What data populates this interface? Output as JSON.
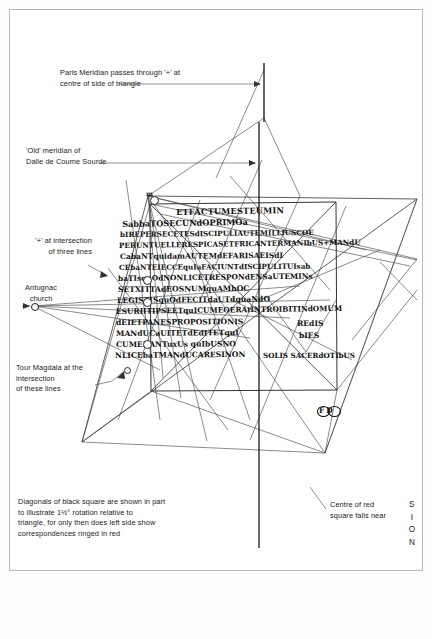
{
  "page": {
    "background": "#ffffff",
    "ink": "#1b1b1b"
  },
  "annotations": {
    "paris_meridian": "Paris Meridian passes through '+' at\ncentre of side of triangle",
    "old_meridian": "'Old' meridian of\nDalle de Coume Sourde",
    "plus_intersection": "'+' at intersection\nof three lines",
    "antugnac_church": "Antugnac\nchurch",
    "tour_magdala": "Tour Magdala at the\nintersection\nof these lines",
    "diagonals_note": "Diagonals of black square are shown in part\nto illustrate 1½° rotation relative to\ntriangle, for only then does left side show\ncorrespondences ringed in red",
    "centre_red_square": "Centre of red\nsquare falls near",
    "sion_letters": [
      "S",
      "I",
      "O",
      "N"
    ],
    "fd_mark": "FD",
    "m_mark": "m"
  },
  "manuscript": {
    "script_name": "latin-uncial",
    "source": "Luke 6:1-4",
    "lines": [
      {
        "text": "ETFACTUMESTEUMIN",
        "x": 176,
        "y": 207,
        "size": 8.2,
        "rot": -1.0,
        "ls": 0.2
      },
      {
        "text": "SabbaTOSECUNdOPRIMOa",
        "x": 122,
        "y": 219,
        "size": 8.2,
        "rot": -1.0,
        "ls": 0.0
      },
      {
        "text": "bIREPERSECETESdISCIPULIAUTEMILLIUSCOE",
        "x": 120,
        "y": 230,
        "size": 7.2,
        "rot": -0.6,
        "ls": 0.0
      },
      {
        "text": "PERUNTUELLERESPICASETFRICANTERMANIbUS+MANdU",
        "x": 119,
        "y": 241,
        "size": 7.2,
        "rot": -0.8,
        "ls": 0.0
      },
      {
        "text": "CabaNTquidamAUTEMdEFARISAEISdI",
        "x": 120,
        "y": 252,
        "size": 7.5,
        "rot": -0.4,
        "ls": 0.0
      },
      {
        "text": "CEbaNTEIECCEquIaFACIUNTdISCIPULITUIsab",
        "x": 119,
        "y": 263,
        "size": 7.2,
        "rot": -0.4,
        "ls": 0.0
      },
      {
        "text": "baTIsquOdNONLICETRESPONdENSaUTEMINs",
        "x": 118,
        "y": 274,
        "size": 7.4,
        "rot": -0.7,
        "ls": 0.0
      },
      {
        "text": "SETXITTAdEOSNUMquAMhOC",
        "x": 118,
        "y": 285,
        "size": 7.6,
        "rot": -0.5,
        "ls": 0.0
      },
      {
        "text": "LEGISTISquOdFECITdaUTdquaNdO",
        "x": 117,
        "y": 296,
        "size": 7.6,
        "rot": -0.6,
        "ls": 0.0
      },
      {
        "text": "ESURIITIPSEETquICUMEOERAtINTROIBITINdOMUM",
        "x": 116,
        "y": 307,
        "size": 7.4,
        "rot": -0.8,
        "ls": 0.0
      },
      {
        "text": "dEIETPANESPROPOSITIONIS",
        "x": 116,
        "y": 318,
        "size": 7.6,
        "rot": -0.4,
        "ls": 0.0
      },
      {
        "text": "MANdUCaUITETdEdITETquI",
        "x": 116,
        "y": 329,
        "size": 7.6,
        "rot": -0.4,
        "ls": 0.0
      },
      {
        "text": "CUMERANTuxUs quIbUSNO",
        "x": 116,
        "y": 340,
        "size": 7.6,
        "rot": -0.3,
        "ls": 0.0
      },
      {
        "text": "NLICEbaTMANdUCARESINON",
        "x": 115,
        "y": 351,
        "size": 7.6,
        "rot": -0.5,
        "ls": 0.0
      }
    ],
    "right_block": [
      {
        "text": "REdIS",
        "x": 297,
        "y": 319,
        "size": 7.6
      },
      {
        "text": "bIES",
        "x": 299,
        "y": 331,
        "size": 7.6
      },
      {
        "text": "SOLIS SACERdOTIbUS",
        "x": 263,
        "y": 351,
        "size": 7.2
      }
    ]
  },
  "geometry": {
    "paris_meridian_x": 264,
    "old_meridian_x": 259,
    "black_square": {
      "x": 150,
      "y": 204,
      "w": 186,
      "h": 186
    },
    "line_color": "#3a3a3a",
    "heavy_color": "#111111"
  }
}
